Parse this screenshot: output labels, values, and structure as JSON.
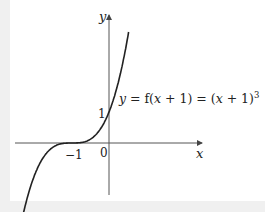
{
  "chart_data": {
    "type": "line",
    "title": "",
    "equation_label": "y = f(x + 1) = (x + 1)³",
    "xlabel": "x",
    "ylabel": "y",
    "origin_label": "0",
    "tick_labels": {
      "x": [
        "−1"
      ],
      "y": [
        "1"
      ]
    },
    "xlim": [
      -2.4,
      2.6
    ],
    "ylim": [
      -1.7,
      4.1
    ],
    "grid": false,
    "legend": null,
    "series": [
      {
        "name": "y = (x + 1)^3",
        "function": "(x+1)^3",
        "x": [
          -2.35,
          -2.0,
          -1.5,
          -1.0,
          -0.5,
          0.0,
          0.5,
          1.0,
          1.03
        ],
        "y": [
          -1.6,
          -1.0,
          -0.125,
          0.0,
          0.125,
          1.0,
          3.375,
          8.0,
          4.1
        ]
      }
    ],
    "key_points": [
      {
        "x": -1,
        "y": 0,
        "note": "point of inflection on x-axis"
      },
      {
        "x": 0,
        "y": 1,
        "note": "y-intercept"
      }
    ],
    "colors": {
      "curve": "#222222",
      "axes": "#555555",
      "background": "#ffffff"
    }
  },
  "labels": {
    "y_axis": "y",
    "x_axis": "x",
    "origin": "0",
    "x_tick_neg1": "−1",
    "y_tick_1": "1",
    "eq_y": "y",
    "eq_mid": " = f(",
    "eq_x1": "x",
    "eq_plus1": " + 1) = (",
    "eq_x2": "x",
    "eq_plus2": " + 1)",
    "eq_exp": "3"
  }
}
